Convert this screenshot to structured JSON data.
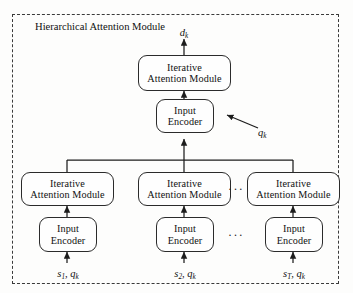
{
  "figure": {
    "title_line1": "Hierarchical",
    "title_line2": "Attention Module",
    "output_label": "d",
    "output_sub": "k",
    "query_label": "q",
    "query_sub": "k",
    "ellipsis": "···",
    "frame_style": "dashed"
  },
  "nodes": {
    "top_iam": {
      "line1": "Iterative",
      "line2": "Attention Module"
    },
    "top_encoder": {
      "line1": "Input",
      "line2": "Encoder"
    },
    "branches": [
      {
        "iam": {
          "line1": "Iterative",
          "line2": "Attention Module"
        },
        "encoder": {
          "line1": "Input",
          "line2": "Encoder"
        },
        "input_seq": "s",
        "input_sub": "1",
        "input_query": "q",
        "input_query_sub": "k",
        "input_sep": ", "
      },
      {
        "iam": {
          "line1": "Iterative",
          "line2": "Attention Module"
        },
        "encoder": {
          "line1": "Input",
          "line2": "Encoder"
        },
        "input_seq": "s",
        "input_sub": "2",
        "input_query": "q",
        "input_query_sub": "k",
        "input_sep": ", "
      },
      {
        "iam": {
          "line1": "Iterative",
          "line2": "Attention Module"
        },
        "encoder": {
          "line1": "Input",
          "line2": "Encoder"
        },
        "input_seq": "s",
        "input_sub": "T",
        "input_query": "q",
        "input_query_sub": "k",
        "input_sep": ", "
      }
    ]
  },
  "colors": {
    "stroke": "#2b2b2b",
    "text": "#111111",
    "background": "#fdfdfc",
    "frame": "#3a3a3a"
  }
}
